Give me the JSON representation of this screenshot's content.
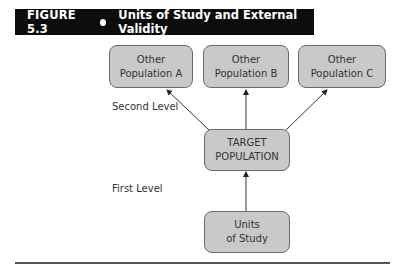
{
  "figure": {
    "number": "FIGURE 5.3",
    "title": "Units of Study and External Validity"
  },
  "diagram": {
    "nodes": {
      "pop_a": {
        "line1": "Other",
        "line2": "Population A"
      },
      "pop_b": {
        "line1": "Other",
        "line2": "Population B"
      },
      "pop_c": {
        "line1": "Other",
        "line2": "Population C"
      },
      "target": {
        "line1": "TARGET",
        "line2": "POPULATION"
      },
      "units": {
        "line1": "Units",
        "line2": "of Study"
      }
    },
    "levels": {
      "second": "Second Level",
      "first": "First Level"
    },
    "edges": [
      {
        "from": "units",
        "to": "target"
      },
      {
        "from": "target",
        "to": "pop_a"
      },
      {
        "from": "target",
        "to": "pop_b"
      },
      {
        "from": "target",
        "to": "pop_c"
      }
    ],
    "colors": {
      "header_bg": "#0d0d0d",
      "box_fill": "#c9c9c9",
      "box_border": "#6a6a6a"
    }
  }
}
